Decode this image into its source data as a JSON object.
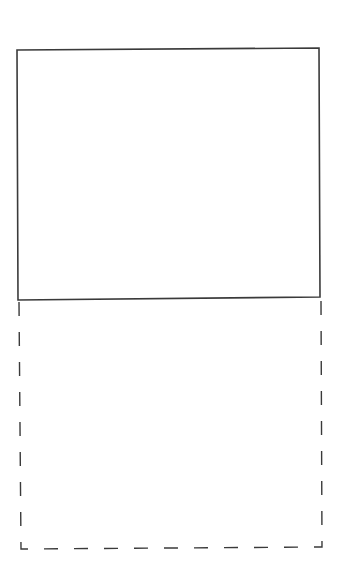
{
  "diagram": {
    "background": "#ffffff",
    "stroke_color": "#3a3a3a",
    "solid_rectangle": {
      "points": [
        [
          17,
          50
        ],
        [
          319,
          48
        ],
        [
          320,
          297
        ],
        [
          18,
          300
        ]
      ],
      "stroke_width": 1.6,
      "style": "solid"
    },
    "dashed_extension": {
      "points": [
        [
          19,
          302
        ],
        [
          21,
          549
        ],
        [
          322,
          547
        ],
        [
          321,
          300
        ]
      ],
      "stroke_width": 1.4,
      "style": "dashed",
      "dash": "14,16"
    }
  }
}
